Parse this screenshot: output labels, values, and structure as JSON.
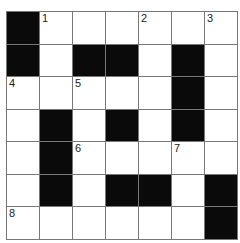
{
  "puzzle": {
    "rows": 7,
    "cols": 7,
    "cells": [
      [
        {
          "b": 1
        },
        {
          "n": "1"
        },
        {},
        {},
        {
          "n": "2"
        },
        {},
        {
          "n": "3"
        }
      ],
      [
        {
          "b": 1
        },
        {},
        {
          "b": 1
        },
        {
          "b": 1
        },
        {},
        {
          "b": 1
        },
        {}
      ],
      [
        {
          "n": "4"
        },
        {},
        {
          "n": "5"
        },
        {},
        {},
        {
          "b": 1
        },
        {}
      ],
      [
        {},
        {
          "b": 1
        },
        {},
        {
          "b": 1
        },
        {},
        {
          "b": 1
        },
        {}
      ],
      [
        {},
        {
          "b": 1
        },
        {
          "n": "6"
        },
        {},
        {},
        {
          "n": "7"
        },
        {}
      ],
      [
        {},
        {
          "b": 1
        },
        {},
        {
          "b": 1
        },
        {
          "b": 1
        },
        {},
        {
          "b": 1
        }
      ],
      [
        {
          "n": "8"
        },
        {},
        {},
        {},
        {},
        {},
        {
          "b": 1
        }
      ]
    ]
  },
  "colors": {
    "block": "#0a0a0a",
    "cell": "#ffffff",
    "line": "#777777"
  }
}
